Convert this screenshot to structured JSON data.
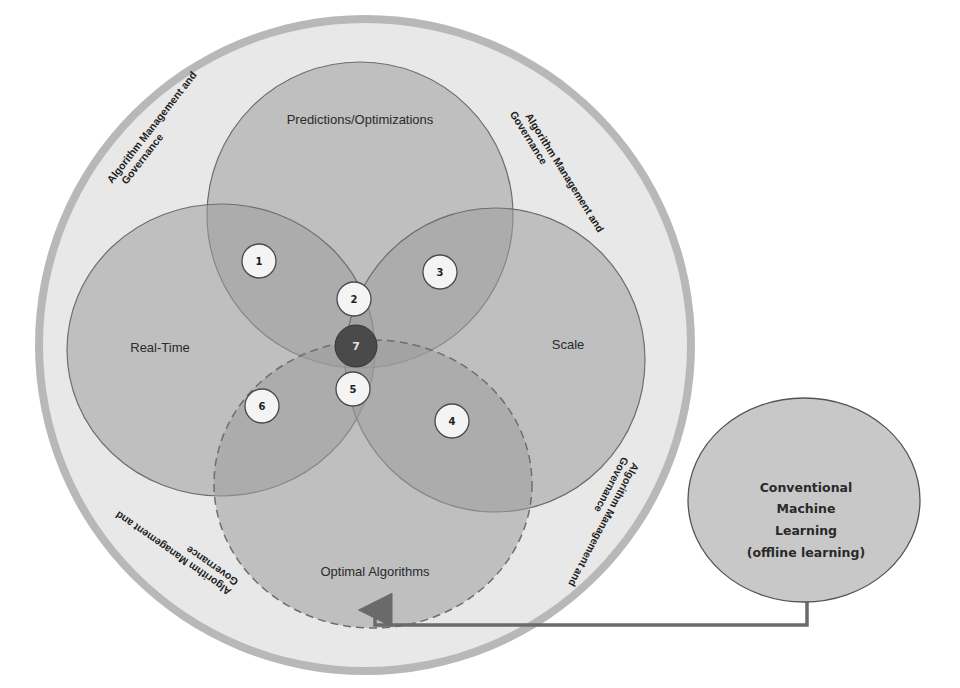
{
  "diagram": {
    "outer_ring": {
      "governance_labels": [
        {
          "line1": "Algorithm Management and",
          "line2": "Governance",
          "position": "top-left"
        },
        {
          "line1": "Algorithm Management and",
          "line2": "Governance",
          "position": "top-right"
        },
        {
          "line1": "Algorithm Management and",
          "line2": "Governance",
          "position": "bottom-left"
        },
        {
          "line1": "Algorithm Management and",
          "line2": "Governance",
          "position": "bottom-right"
        }
      ]
    },
    "sets": {
      "top": "Predictions/Optimizations",
      "left": "Real-Time",
      "right": "Scale",
      "bottom": "Optimal Algorithms"
    },
    "badges": [
      "1",
      "2",
      "3",
      "4",
      "5",
      "6",
      "7"
    ],
    "external": {
      "line1": "Conventional",
      "line2": "Machine",
      "line3": "Learning",
      "line4": "(offline learning)"
    },
    "colors": {
      "outer_ring": "#b5b5b5",
      "outer_fill": "#e6e6e6",
      "set_fill": "#9a9a9a",
      "set_stroke": "#6e6e6e",
      "badge_fill": "#f2f2f2",
      "center_badge": "#4a4a4a",
      "connector": "#6a6a6a"
    }
  }
}
